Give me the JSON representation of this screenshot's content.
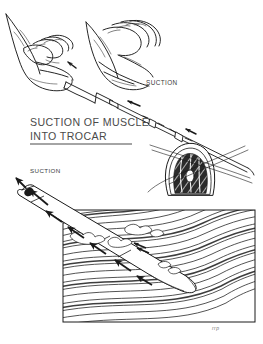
{
  "figure": {
    "kind": "medical-line-illustration",
    "subject": "Suction of muscle into trocar",
    "background_color": "#ffffff",
    "ink_color": "#1a1a1a",
    "text_color": "#3a3a3a",
    "width": 263,
    "height": 344
  },
  "labels": {
    "title_line1": "SUCTION OF MUSCLE",
    "title_line2": "INTO TROCAR",
    "suction_upper": "SUCTION",
    "suction_lower": "SUCTION",
    "signature": "rrp"
  },
  "panels": {
    "upper": {
      "name": "hands-holding-trocar",
      "description": "Two hands gripping a syringe attached to a trocar tube, with flow arrows directed toward the syringe and a muscle cross-section at lower right.",
      "elements": [
        "left-hand",
        "right-hand",
        "syringe-barrel",
        "trocar-tube",
        "luer-collar",
        "muscle-cross-section",
        "flow-arrow"
      ]
    },
    "lower": {
      "name": "trocar-in-muscle-detail",
      "description": "Magnified detail of the trocar cannula embedded in striated muscle, with arrows showing tissue drawn proximally up the cannula.",
      "elements": [
        "trocar-cannula",
        "cannula-window",
        "muscle-fiber-field",
        "aspirated-tissue",
        "flow-arrow",
        "tissue-box-frame"
      ]
    }
  },
  "arrows": {
    "count": 9,
    "direction": "proximal (toward suction source)",
    "meaning": "direction of suction flow"
  }
}
